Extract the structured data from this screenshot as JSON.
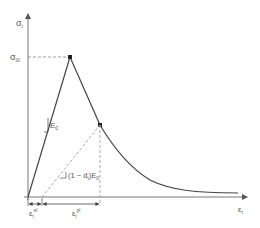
{
  "diagram": {
    "type": "stress-strain damage curve",
    "y_axis": {
      "label": "σ",
      "label_sub": "t"
    },
    "x_axis": {
      "label": "ε",
      "label_sub": "t"
    },
    "peak_label": {
      "main": "σ",
      "sub": "t0"
    },
    "initial_slope_label": {
      "main": "E",
      "sub": "0"
    },
    "unloading_slope_label": {
      "prefix": "(1 − d",
      "prefix_sub": "t",
      "mid": ")E",
      "suffix_sub": "0"
    },
    "strain_labels": [
      {
        "main": "ε",
        "sub": "t",
        "sup": "el"
      },
      {
        "main": "ε",
        "sub": "t",
        "sup": "pl"
      }
    ]
  },
  "colors": {
    "line": "#333333",
    "dashed": "#999999",
    "axis": "#666666",
    "text": "#555555"
  }
}
